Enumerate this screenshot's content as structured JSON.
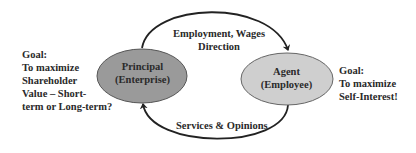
{
  "diagram": {
    "nodes": {
      "principal": {
        "line1": "Principal",
        "line2": "(Enterprise)",
        "fill": "#9a9a9a"
      },
      "agent": {
        "line1": "Agent",
        "line2": "(Employee)",
        "fill": "#cfcfcf"
      }
    },
    "edges": {
      "top": {
        "line1": "Employment, Wages",
        "line2": "Direction",
        "from": "principal",
        "to": "agent"
      },
      "bottom": {
        "label": "Services & Opinions",
        "from": "agent",
        "to": "principal"
      }
    },
    "goals": {
      "left": {
        "lines": [
          "Goal:",
          "To maximize",
          "Shareholder",
          "Value – Short-",
          "term or Long-term?"
        ]
      },
      "right": {
        "lines": [
          "Goal:",
          "To maximize",
          "Self-Interest!"
        ]
      }
    }
  }
}
